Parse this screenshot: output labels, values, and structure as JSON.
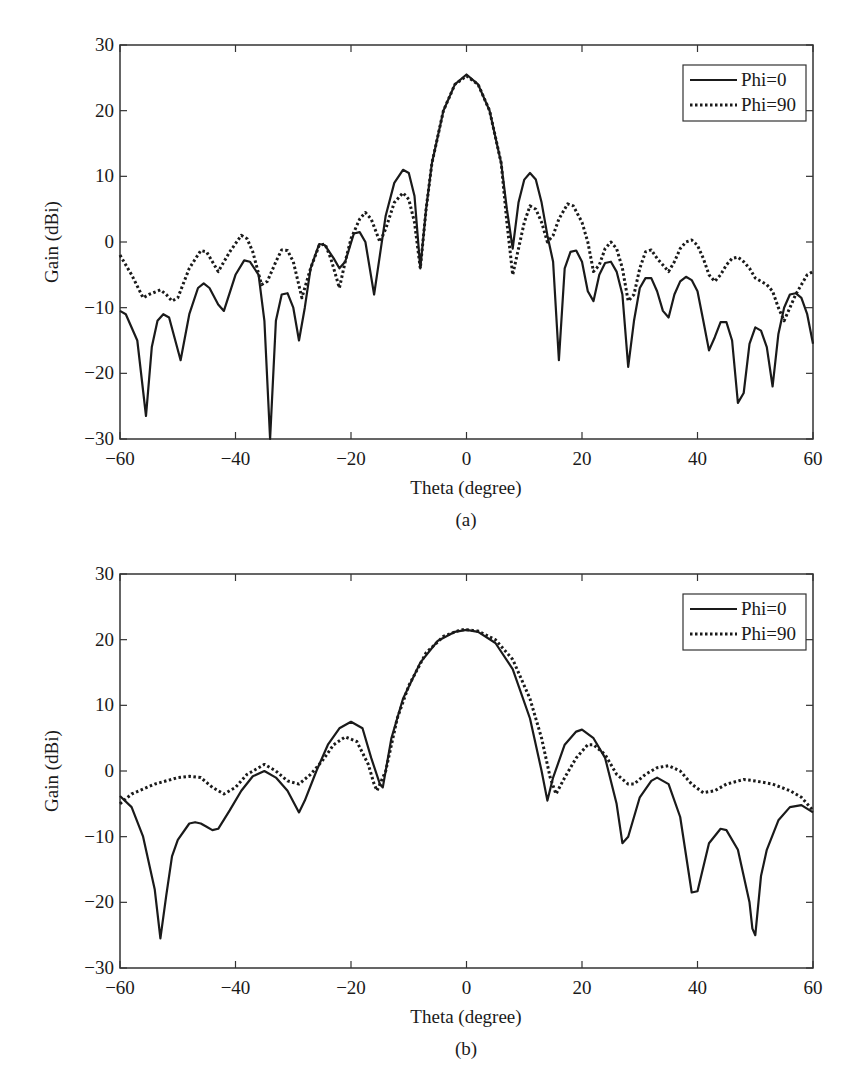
{
  "colors": {
    "line": "#1a1a1a",
    "axis": "#333333",
    "background": "#ffffff"
  },
  "chart_data": [
    {
      "type": "line",
      "panel": "(a)",
      "title": "",
      "caption": "(a)",
      "xlabel": "Theta (degree)",
      "ylabel": "Gain (dBi)",
      "xlim": [
        -60,
        60
      ],
      "ylim": [
        -30,
        30
      ],
      "xticks": [
        -60,
        -40,
        -20,
        0,
        20,
        40,
        60
      ],
      "yticks": [
        -30,
        -20,
        -10,
        0,
        10,
        20,
        30
      ],
      "xtick_labels": [
        "−60",
        "−40",
        "−20",
        "0",
        "20",
        "40",
        "60"
      ],
      "ytick_labels": [
        "−30",
        "−20",
        "−10",
        "0",
        "10",
        "20",
        "30"
      ],
      "grid": false,
      "legend_position": "upper right",
      "series": [
        {
          "name": "Phi=0",
          "style": "solid",
          "x": [
            -60,
            -59,
            -57,
            -55.5,
            -54.5,
            -53.5,
            -52.5,
            -51.5,
            -49.5,
            -48,
            -46.5,
            -45.5,
            -44.5,
            -43,
            -42,
            -40,
            -38.5,
            -37.5,
            -36,
            -35,
            -34,
            -33,
            -32,
            -31,
            -30,
            -29,
            -28,
            -27,
            -25.5,
            -24.5,
            -23,
            -22,
            -21,
            -19.5,
            -18.5,
            -17.5,
            -16,
            -15,
            -14,
            -12.5,
            -11,
            -10,
            -9,
            -8,
            -7,
            -6,
            -4,
            -2,
            0,
            2,
            4,
            6,
            7,
            8,
            9,
            10,
            11,
            12,
            13,
            14,
            15,
            16,
            17,
            18,
            19,
            20,
            21,
            22,
            23,
            24,
            25,
            26,
            27,
            28,
            29,
            30,
            31,
            32,
            33,
            34,
            35,
            36,
            37,
            38,
            39,
            40,
            41,
            42,
            43,
            44,
            45,
            46,
            47,
            48,
            49,
            50,
            51,
            52,
            53,
            54,
            55,
            56,
            57,
            58,
            59,
            60
          ],
          "values": [
            -10.5,
            -11,
            -15,
            -26.5,
            -16,
            -12,
            -11,
            -11.5,
            -18,
            -11,
            -7,
            -6.3,
            -7,
            -9.5,
            -10.5,
            -5,
            -2.8,
            -3,
            -5,
            -12,
            -30,
            -12,
            -8,
            -7.8,
            -10,
            -15,
            -10,
            -4,
            -0.3,
            -0.5,
            -2.5,
            -4,
            -3,
            1.3,
            1.5,
            0,
            -8,
            -2,
            4,
            9,
            11,
            10.5,
            7,
            -4,
            5,
            12,
            20,
            24,
            25.5,
            24,
            20,
            12,
            5,
            -1,
            6,
            9.5,
            10.5,
            9.5,
            6,
            1,
            -3,
            -18,
            -4,
            -1.5,
            -1.3,
            -3,
            -7.5,
            -9,
            -5,
            -3.2,
            -3,
            -4.5,
            -8,
            -19,
            -12,
            -7,
            -5.5,
            -5.5,
            -7.5,
            -10.5,
            -11.5,
            -8,
            -6,
            -5.3,
            -5.8,
            -7.5,
            -12,
            -16.5,
            -14.5,
            -12.2,
            -12.2,
            -15,
            -24.5,
            -23,
            -15.5,
            -13,
            -13.5,
            -16,
            -22,
            -14,
            -10,
            -8,
            -7.8,
            -8.5,
            -11,
            -15.5
          ]
        },
        {
          "name": "Phi=90",
          "style": "dotted",
          "x": [
            -60,
            -58,
            -56,
            -55,
            -53,
            -52,
            -51,
            -50,
            -48,
            -46,
            -45,
            -44,
            -43,
            -41,
            -39,
            -38,
            -37,
            -35.5,
            -34.5,
            -33,
            -32,
            -31,
            -30,
            -28.5,
            -27,
            -25.5,
            -24.5,
            -23.5,
            -22,
            -21,
            -20,
            -18.5,
            -17.5,
            -16.5,
            -15,
            -14,
            -12.5,
            -11,
            -10,
            -9,
            -8,
            -7,
            -6,
            -4,
            -2,
            0,
            2,
            4,
            6,
            7,
            8,
            9,
            10,
            11,
            12,
            13,
            14,
            15,
            16,
            17.5,
            18.5,
            20,
            21,
            22,
            23,
            24,
            25,
            26,
            27,
            28,
            29,
            30,
            31,
            32,
            33,
            34,
            35,
            36,
            37,
            38,
            39,
            40,
            41,
            42,
            43,
            44,
            45,
            46,
            47,
            48,
            49,
            50,
            51,
            52,
            53,
            54,
            55,
            56,
            57,
            58,
            59,
            60
          ],
          "values": [
            -2,
            -5,
            -8.5,
            -8,
            -7.3,
            -8,
            -9,
            -8.5,
            -4,
            -1.3,
            -1.5,
            -3,
            -4.5,
            -1.5,
            1,
            0.5,
            -1.5,
            -6.5,
            -6,
            -3,
            -1.2,
            -1.3,
            -3,
            -8.5,
            -4,
            -0.5,
            -0.3,
            -2.5,
            -7,
            -3,
            0.5,
            3.5,
            4.5,
            3.5,
            0,
            2,
            6,
            7.5,
            6.5,
            3,
            -4,
            5,
            12,
            20,
            24,
            25.3,
            24,
            20,
            12,
            3,
            -5,
            -1,
            3,
            5.5,
            5,
            3,
            0,
            1,
            3.5,
            5.8,
            5.5,
            3,
            0,
            -4.5,
            -3.5,
            -1,
            0,
            -1,
            -4,
            -9,
            -8,
            -4,
            -1.5,
            -1.2,
            -2.5,
            -3.5,
            -4.5,
            -3,
            -1,
            0,
            0.3,
            -0.5,
            -2.5,
            -5,
            -6,
            -5,
            -3.5,
            -2.5,
            -2.3,
            -3,
            -4,
            -5.5,
            -6,
            -6.5,
            -7.5,
            -10,
            -12,
            -10,
            -8,
            -6.5,
            -5,
            -4.5
          ]
        }
      ]
    },
    {
      "type": "line",
      "panel": "(b)",
      "title": "",
      "caption": "(b)",
      "xlabel": "Theta (degree)",
      "ylabel": "Gain (dBi)",
      "xlim": [
        -60,
        60
      ],
      "ylim": [
        -30,
        30
      ],
      "xticks": [
        -60,
        -40,
        -20,
        0,
        20,
        40,
        60
      ],
      "yticks": [
        -30,
        -20,
        -10,
        0,
        10,
        20,
        30
      ],
      "xtick_labels": [
        "−60",
        "−40",
        "−20",
        "0",
        "20",
        "40",
        "60"
      ],
      "ytick_labels": [
        "−30",
        "−20",
        "−10",
        "0",
        "10",
        "20",
        "30"
      ],
      "grid": false,
      "legend_position": "upper right",
      "series": [
        {
          "name": "Phi=0",
          "style": "solid",
          "x": [
            -60,
            -58,
            -56,
            -54,
            -53,
            -52,
            -51,
            -50,
            -48,
            -47,
            -46,
            -45,
            -44,
            -43,
            -41,
            -39,
            -37,
            -35,
            -33,
            -31,
            -29,
            -28,
            -26,
            -24,
            -22,
            -20,
            -18,
            -16.5,
            -15,
            -14.5,
            -13,
            -11,
            -8,
            -5,
            -2,
            0,
            2,
            5,
            8,
            11,
            13,
            14,
            15,
            17,
            19,
            20,
            22,
            24,
            26,
            27,
            28,
            30,
            32,
            33,
            35,
            37,
            39,
            40,
            42,
            44,
            45,
            47,
            49,
            49.5,
            50,
            51,
            52,
            54,
            56,
            58,
            60
          ],
          "values": [
            -3.8,
            -5.5,
            -10,
            -18,
            -25.5,
            -19,
            -13,
            -10.5,
            -8,
            -7.8,
            -8,
            -8.5,
            -9,
            -8.8,
            -6,
            -3,
            -0.8,
            0,
            -1,
            -3,
            -6.3,
            -4.5,
            0,
            4,
            6.5,
            7.5,
            6.5,
            2,
            -2,
            -2.5,
            5,
            11,
            16.5,
            19.8,
            21.2,
            21.5,
            21.2,
            19.5,
            15.5,
            8,
            0,
            -4.5,
            -1,
            4,
            6,
            6.3,
            5,
            2,
            -5,
            -11,
            -10,
            -4,
            -1.5,
            -1,
            -2,
            -7,
            -18.5,
            -18.3,
            -11,
            -8.8,
            -9,
            -12,
            -20,
            -24,
            -25,
            -16,
            -12,
            -7.5,
            -5.5,
            -5.2,
            -6.3
          ]
        },
        {
          "name": "Phi=90",
          "style": "dotted",
          "x": [
            -60,
            -58,
            -54,
            -50,
            -48,
            -46,
            -44,
            -42,
            -40,
            -38,
            -35,
            -33,
            -31,
            -29,
            -27,
            -25,
            -23,
            -21,
            -19,
            -17,
            -16,
            -15.5,
            -14,
            -12,
            -10,
            -7,
            -4,
            -1,
            0,
            2,
            5,
            8,
            11,
            13,
            14.5,
            15.5,
            17,
            19,
            21,
            22,
            24,
            26,
            28,
            29,
            31,
            33,
            35,
            37,
            39,
            41,
            43,
            45,
            48,
            50,
            53,
            56,
            58,
            60
          ],
          "values": [
            -5,
            -3.5,
            -2,
            -1,
            -0.8,
            -1,
            -2.5,
            -3.5,
            -2.5,
            -0.5,
            1,
            0,
            -1.5,
            -2,
            -0.5,
            1.5,
            4,
            5.2,
            4.5,
            1,
            -2,
            -3,
            0,
            8,
            13,
            18,
            20.5,
            21.5,
            21.5,
            21.3,
            20,
            17,
            11,
            5,
            -1,
            -3.5,
            -1,
            2,
            4,
            4,
            2.5,
            -0.5,
            -2,
            -2,
            -0.5,
            0.5,
            0.8,
            0,
            -2,
            -3.3,
            -3,
            -2,
            -1.3,
            -1.5,
            -2,
            -3,
            -4,
            -6
          ]
        }
      ]
    }
  ],
  "panels": [
    {
      "ylabel": "Gain (dBi)",
      "xlabel": "Theta (degree)",
      "caption": "(a)",
      "legend": [
        {
          "label": "Phi=0",
          "style": "solid"
        },
        {
          "label": "Phi=90",
          "style": "dotted"
        }
      ]
    },
    {
      "ylabel": "Gain (dBi)",
      "xlabel": "Theta (degree)",
      "caption": "(b)",
      "legend": [
        {
          "label": "Phi=0",
          "style": "solid"
        },
        {
          "label": "Phi=90",
          "style": "dotted"
        }
      ]
    }
  ]
}
